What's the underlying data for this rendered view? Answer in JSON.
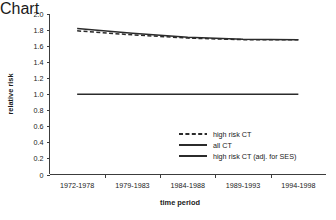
{
  "chart_data": {
    "type": "line",
    "title": "",
    "xlabel": "time period",
    "ylabel": "relative risk",
    "categories": [
      "1972-1978",
      "1979-1983",
      "1984-1988",
      "1989-1993",
      "1994-1998"
    ],
    "ylim": [
      0,
      2.0
    ],
    "yticks": [
      "0",
      "0.2",
      "0.4",
      "0.6",
      "0.8",
      "1.0",
      "1.2",
      "1.4",
      "1.6",
      "1.8",
      "2.0"
    ],
    "ytick_values": [
      0,
      0.2,
      0.4,
      0.6,
      0.8,
      1.0,
      1.2,
      1.4,
      1.6,
      1.8,
      2.0
    ],
    "grid": false,
    "legend_position": "inside-lower-right",
    "series": [
      {
        "name": "high risk CT",
        "style": "dashed",
        "color": "#2b2b2b",
        "values": [
          1.79,
          1.74,
          1.7,
          1.68,
          1.68
        ]
      },
      {
        "name": "all CT",
        "style": "solid",
        "color": "#2b2b2b",
        "values": [
          1.82,
          1.76,
          1.71,
          1.685,
          1.68
        ]
      },
      {
        "name": "high risk CT (adj. for SES)",
        "style": "solid",
        "color": "#2b2b2b",
        "values": [
          1.0,
          1.0,
          1.0,
          1.0,
          1.0
        ]
      }
    ]
  },
  "legend": {
    "entries": [
      {
        "label": "high risk CT"
      },
      {
        "label": "all CT"
      },
      {
        "label": "high risk CT (adj. for SES)"
      }
    ]
  }
}
